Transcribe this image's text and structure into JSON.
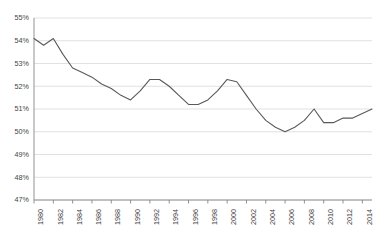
{
  "chart_data": {
    "type": "line",
    "title": "",
    "subtitle": "",
    "xlabel": "",
    "ylabel": "",
    "grid": true,
    "legend": false,
    "legend_position": "none",
    "line_color": "#595959",
    "grid_color": "#d9d9d9",
    "axis_color": "#868686",
    "background_color": "#ffffff",
    "tick_label_color": "#3f3f3f",
    "xlim": [
      1980,
      2015
    ],
    "ylim": [
      47,
      55
    ],
    "ytick_labels": [
      "55%",
      "54%",
      "53%",
      "52%",
      "51%",
      "50%",
      "49%",
      "48%",
      "47%"
    ],
    "ytick_values": [
      55,
      54,
      53,
      52,
      51,
      50,
      49,
      48,
      47
    ],
    "xtick_labels": [
      "1980",
      "1982",
      "1984",
      "1986",
      "1988",
      "1990",
      "1992",
      "1994",
      "1996",
      "1998",
      "2000",
      "2002",
      "2004",
      "2006",
      "2008",
      "2010",
      "2012",
      "2014"
    ],
    "xtick_values": [
      1980,
      1982,
      1984,
      1986,
      1988,
      1990,
      1992,
      1994,
      1996,
      1998,
      2000,
      2002,
      2004,
      2006,
      2008,
      2010,
      2012,
      2014
    ],
    "x": [
      1980,
      1981,
      1982,
      1983,
      1984,
      1985,
      1986,
      1987,
      1988,
      1989,
      1990,
      1991,
      1992,
      1993,
      1994,
      1995,
      1996,
      1997,
      1998,
      1999,
      2000,
      2001,
      2002,
      2003,
      2004,
      2005,
      2006,
      2007,
      2008,
      2009,
      2010,
      2011,
      2012,
      2013,
      2014,
      2015
    ],
    "values": [
      54.1,
      53.8,
      54.1,
      53.4,
      52.8,
      52.6,
      52.4,
      52.1,
      51.9,
      51.6,
      51.4,
      51.8,
      52.3,
      52.3,
      52.0,
      51.6,
      51.2,
      51.2,
      51.4,
      51.8,
      52.3,
      52.2,
      51.6,
      51.0,
      50.5,
      50.2,
      50.0,
      50.2,
      50.5,
      51.0,
      50.4,
      50.4,
      50.6,
      50.6,
      50.8,
      51.0
    ],
    "series": [
      {
        "name": "",
        "values": [
          54.1,
          53.8,
          54.1,
          53.4,
          52.8,
          52.6,
          52.4,
          52.1,
          51.9,
          51.6,
          51.4,
          51.8,
          52.3,
          52.3,
          52.0,
          51.6,
          51.2,
          51.2,
          51.4,
          51.8,
          52.3,
          52.2,
          51.6,
          51.0,
          50.5,
          50.2,
          50.0,
          50.2,
          50.5,
          51.0,
          50.4,
          50.4,
          50.6,
          50.6,
          50.8,
          51.0
        ]
      }
    ]
  },
  "plot_geometry": {
    "left": 34,
    "right": 372,
    "top": 18,
    "bottom": 200
  }
}
